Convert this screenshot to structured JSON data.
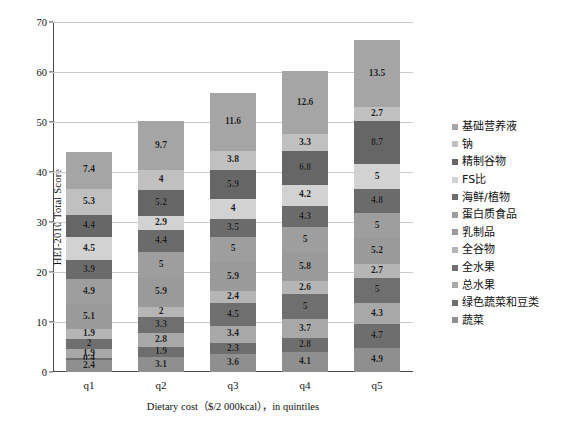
{
  "chart_data": {
    "type": "bar",
    "stacked": true,
    "title": "",
    "xlabel": "Dietary cost（$/2 000kcal），in quintiles",
    "ylabel": "HEI-2010 Total Score",
    "categories": [
      "q1",
      "q2",
      "q3",
      "q4",
      "q5"
    ],
    "ylim": [
      0,
      70
    ],
    "yticks": [
      0,
      10,
      20,
      30,
      40,
      50,
      60,
      70
    ],
    "grid": true,
    "legend_position": "right",
    "totals": [
      44,
      50,
      56,
      60,
      66
    ],
    "series": [
      {
        "name": "蔬菜",
        "color": "#8f8f8f",
        "values": [
          2.4,
          3.1,
          3.6,
          4.1,
          4.9
        ]
      },
      {
        "name": "绿色蔬菜和豆类",
        "color": "#6e6e6e",
        "values": [
          0.4,
          1.9,
          2.3,
          2.8,
          4.7
        ]
      },
      {
        "name": "总水果",
        "color": "#a8a8a8",
        "values": [
          1.9,
          2.8,
          3.4,
          3.7,
          4.3
        ]
      },
      {
        "name": "全水果",
        "color": "#6f6f6f",
        "values": [
          2.0,
          3.3,
          4.5,
          5.0,
          5.0
        ]
      },
      {
        "name": "全谷物",
        "color": "#b5b5b5",
        "values": [
          1.9,
          2.0,
          2.4,
          2.6,
          2.7
        ]
      },
      {
        "name": "乳制品",
        "color": "#9a9a9a",
        "values": [
          5.1,
          5.9,
          5.9,
          5.8,
          5.2
        ]
      },
      {
        "name": "蛋白质食品",
        "color": "#9e9e9e",
        "values": [
          4.9,
          5.0,
          5.0,
          5.0,
          5.0
        ]
      },
      {
        "name": "海鲜/植物",
        "color": "#6b6b6b",
        "values": [
          3.9,
          4.4,
          3.5,
          4.3,
          4.8
        ]
      },
      {
        "name": "FS比",
        "color": "#d2d2d2",
        "values": [
          4.5,
          2.9,
          4.0,
          4.2,
          5.0
        ]
      },
      {
        "name": "精制谷物",
        "color": "#666666",
        "values": [
          4.4,
          5.2,
          5.9,
          6.8,
          8.7
        ]
      },
      {
        "name": "钠",
        "color": "#c0c0c0",
        "values": [
          5.3,
          4.0,
          3.8,
          3.3,
          2.7
        ]
      },
      {
        "name": "基础营养液",
        "color": "#a5a5a5",
        "values": [
          7.4,
          9.7,
          11.6,
          12.6,
          13.5
        ]
      }
    ],
    "legend_order_top_down": [
      "基础营养液",
      "钠",
      "精制谷物",
      "FS比",
      "海鲜/植物",
      "蛋白质食品",
      "乳制品",
      "全谷物",
      "全水果",
      "总水果",
      "绿色蔬菜和豆类",
      "蔬菜"
    ]
  }
}
